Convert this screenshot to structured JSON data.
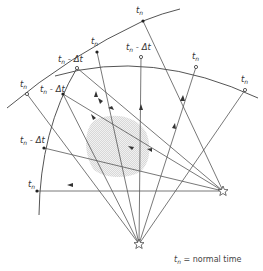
{
  "diagram": {
    "labels": {
      "tn": "t",
      "sub_n": "n",
      "tn_minus_dt_suffix": " - Δt"
    },
    "points": [
      {
        "id": "p1",
        "label": "tn",
        "x": 143,
        "y": 21,
        "arc": "outer",
        "lx": 136,
        "ly": 12
      },
      {
        "id": "p2",
        "label": "tn",
        "x": 97,
        "y": 52,
        "arc": "outer",
        "lx": 92,
        "ly": 43
      },
      {
        "id": "p3",
        "label": "tn-Δt",
        "x": 77,
        "y": 68,
        "arc": "inner",
        "lx": 62,
        "ly": 61
      },
      {
        "id": "p4",
        "label": "tn-Δt",
        "x": 141,
        "y": 57,
        "arc": "inner",
        "lx": 126,
        "ly": 50
      },
      {
        "id": "p5",
        "label": "tn",
        "x": 196,
        "y": 67,
        "arc": "inner",
        "lx": 192,
        "ly": 58
      },
      {
        "id": "p6",
        "label": "tn",
        "x": 245,
        "y": 90,
        "arc": "inner",
        "lx": 240,
        "ly": 81
      },
      {
        "id": "p7",
        "label": "tn",
        "x": 27,
        "y": 94,
        "arc": "outer",
        "lx": 20,
        "ly": 86
      },
      {
        "id": "p8",
        "label": "tn-Δt",
        "x": 63,
        "y": 94,
        "arc": "none",
        "lx": 42,
        "ly": 87
      },
      {
        "id": "p9",
        "label": "tn-Δt",
        "x": 44,
        "y": 148,
        "arc": "left",
        "lx": 21,
        "ly": 142
      },
      {
        "id": "p10",
        "label": "tn",
        "x": 37,
        "y": 191,
        "arc": "left",
        "lx": 29,
        "ly": 186
      }
    ],
    "sources": [
      {
        "id": "star-bottom",
        "x": 139,
        "y": 244
      },
      {
        "id": "star-right",
        "x": 223,
        "y": 191
      }
    ],
    "anomaly": {
      "cx": 110,
      "cy": 148,
      "rx": 30,
      "ry": 30
    },
    "caption": {
      "symbol": "t",
      "sub": "n",
      "text": " =  normal time"
    }
  }
}
